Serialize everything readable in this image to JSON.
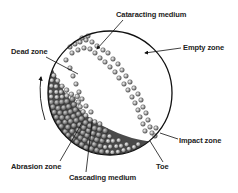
{
  "diagram": {
    "labels": {
      "cataracting_medium": "Cataracting medium",
      "empty_zone": "Empty zone",
      "dead_zone": "Dead zone",
      "impact_zone": "Impact zone",
      "abrasion_zone": "Abrasion zone",
      "cascading_medium": "Cascading medium",
      "toe": "Toe"
    },
    "rotation_direction": "counter-clockwise",
    "colors": {
      "outline": "#111111",
      "ball_fill_light": "#c8c8c8",
      "ball_fill_dark": "#707070",
      "ball_stroke": "#333333",
      "background": "#ffffff"
    }
  }
}
